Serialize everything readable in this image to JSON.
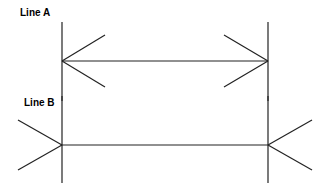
{
  "labels": {
    "line_a": "Line A",
    "line_b": "Line B"
  },
  "colors": {
    "stroke": "#222222",
    "background": "#ffffff"
  },
  "figures": [
    {
      "name": "Line A",
      "fins": "inward",
      "y": 61,
      "x1": 62,
      "x2": 268
    },
    {
      "name": "Line B",
      "fins": "outward",
      "y": 145,
      "x1": 62,
      "x2": 268
    }
  ]
}
